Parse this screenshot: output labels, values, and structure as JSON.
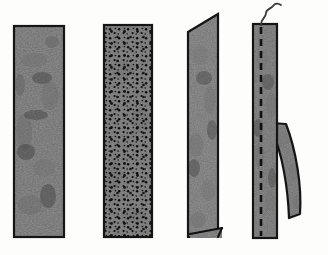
{
  "figure": {
    "title": "Four textile specimen strips",
    "background_color": "#fdfdfc",
    "width": 328,
    "height": 255,
    "outline_color": "#151515",
    "fabric_base_color": "#4a4a4a",
    "fabric_dark_color": "#2e2e2e",
    "fabric_light_color": "#6f6f6f",
    "perforation_color": "#0d0d0d",
    "stitch_color": "#111111",
    "thread_color": "#3a3a3a"
  },
  "panels": [
    {
      "id": "panel-a",
      "label": "a",
      "name": "plain-fabric-strip",
      "description": "Plain rectangular mottled fabric strip",
      "shape": "rectangle",
      "x": 14,
      "y": 26,
      "width": 50,
      "height": 211,
      "has_perforations": false,
      "has_stitch_line": false,
      "has_thread": false,
      "has_peeled_strip": false
    },
    {
      "id": "panel-b",
      "label": "b",
      "name": "perforated-fabric-strip",
      "description": "Rectangular fabric strip covered with dense needle perforations",
      "shape": "rectangle",
      "x": 104,
      "y": 25,
      "width": 48,
      "height": 212,
      "has_perforations": true,
      "perforation_count": 260,
      "has_stitch_line": false,
      "has_thread": false,
      "has_peeled_strip": false
    },
    {
      "id": "panel-c",
      "label": "c",
      "name": "slanted-fabric-strip",
      "description": "Fabric strip with slanted top edge and a small lifted flap at the bottom right",
      "shape": "slanted-quadrilateral",
      "x": 188,
      "y": 14,
      "width": 30,
      "height": 223,
      "top_slant_px": 18,
      "has_perforations": false,
      "has_stitch_line": false,
      "has_thread": false,
      "has_peeled_strip": false,
      "has_bottom_flap": true
    },
    {
      "id": "panel-d",
      "label": "d",
      "name": "stitched-fabric-strip",
      "description": "Narrow fabric strip with a dashed seam line, a loose thread rising from the top and a curved strip peeling away to the right",
      "shape": "rectangle",
      "x": 253,
      "y": 24,
      "width": 24,
      "height": 214,
      "has_perforations": false,
      "has_stitch_line": true,
      "stitch_dash_count": 20,
      "has_thread": true,
      "has_peeled_strip": true,
      "peel_origin_y": 123,
      "peel_end_y": 218
    }
  ],
  "annotations": {
    "thread": {
      "name": "loose-thread",
      "description": "Wavy loose thread extending above the stitched strip"
    },
    "peeled_strip": {
      "name": "peeled-strip",
      "description": "Curved band of fabric separating from the right edge of the stitched strip"
    },
    "bottom_flap": {
      "name": "bottom-flap",
      "description": "Small triangular lifted flap at the base of the slanted strip"
    }
  }
}
